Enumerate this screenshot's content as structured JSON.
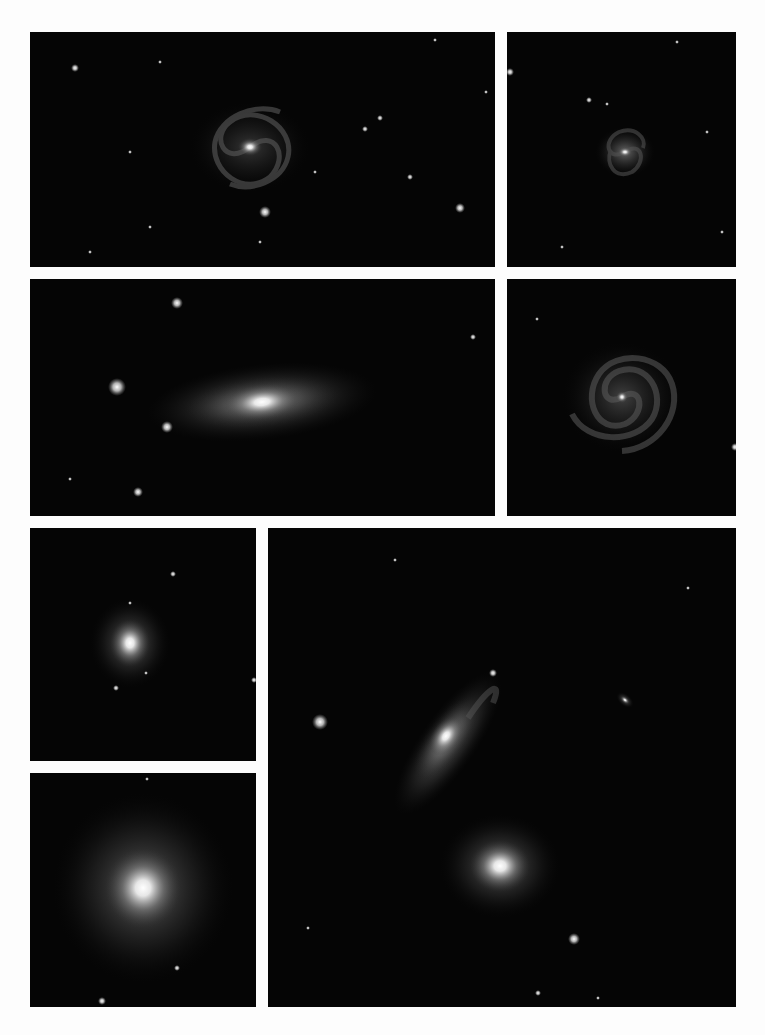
{
  "plate": {
    "background": "#fdfdfd",
    "panel_background": "#050505",
    "panels": [
      {
        "id": "p1",
        "subject": "face-on spiral galaxy with loose arms"
      },
      {
        "id": "p2",
        "subject": "small barred spiral galaxy"
      },
      {
        "id": "p3",
        "subject": "inclined spiral galaxy with bright bulge"
      },
      {
        "id": "p4",
        "subject": "face-on grand-design spiral galaxy"
      },
      {
        "id": "p5",
        "subject": "small elliptical galaxy"
      },
      {
        "id": "p6",
        "subject": "elliptical galaxy with diffuse halo"
      },
      {
        "id": "p7",
        "subject": "interacting galaxy group: edge-on disturbed spiral, elliptical, small companion"
      }
    ]
  }
}
